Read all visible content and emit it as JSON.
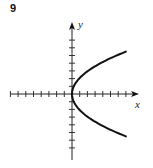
{
  "figure": {
    "number": "9"
  },
  "chart_data": {
    "type": "line",
    "title": "",
    "xlabel": "x",
    "ylabel": "y",
    "grid": false,
    "legend": null,
    "tick_spacing_units": 1,
    "xlim": [
      -8,
      8
    ],
    "ylim": [
      -8,
      8
    ],
    "x_ticks_left": 8,
    "x_ticks_right": 7,
    "y_ticks_up": 7,
    "y_ticks_down": 7,
    "series": [
      {
        "name": "parabola opening right",
        "equation": "x = k*y^2 (k≈0.23)",
        "x": [
          7.0,
          4.9,
          3.2,
          1.8,
          0.8,
          0.2,
          0.0,
          0.2,
          0.8,
          1.8,
          3.2,
          4.9,
          7.0
        ],
        "y": [
          5.5,
          4.6,
          3.7,
          2.8,
          1.8,
          0.9,
          0.0,
          -0.9,
          -1.8,
          -2.8,
          -3.7,
          -4.6,
          -5.5
        ]
      }
    ],
    "color": "#111111"
  }
}
